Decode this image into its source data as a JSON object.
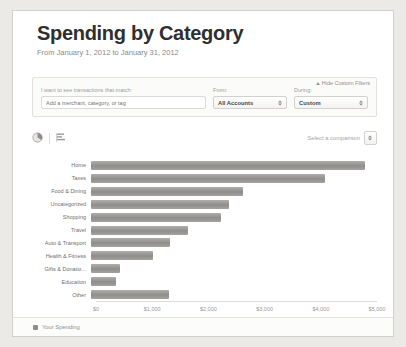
{
  "header": {
    "title": "Spending by Category",
    "date_range": "From January 1, 2012 to January 31, 2012"
  },
  "filters": {
    "hide_filters_label": "Hide Custom Filters",
    "match_label": "I want to see transactions that match:",
    "match_placeholder": "Add a merchant, category, or tag",
    "match_value": "",
    "from_label": "From:",
    "from_value": "All Accounts",
    "during_label": "During:",
    "during_value": "Custom"
  },
  "toolbar": {
    "pie_icon": "pie-chart-icon",
    "bar_icon": "bar-chart-icon",
    "comparison_label": "Select a comparison"
  },
  "footer": {
    "legend_label": "Your Spending",
    "legend_color": "#8f8d89"
  },
  "chart_data": {
    "type": "bar",
    "orientation": "horizontal",
    "title": "Spending by Category",
    "xlabel": "",
    "ylabel": "",
    "xlim": [
      0,
      5000
    ],
    "grid": false,
    "legend_position": "bottom-left",
    "bar_color": "#8f8d89",
    "tick_labels": [
      "$0",
      "$1,000",
      "$2,000",
      "$3,000",
      "$4,000",
      "$5,000"
    ],
    "tick_values": [
      0,
      1000,
      2000,
      3000,
      4000,
      5000
    ],
    "categories": [
      "Home",
      "Taxes",
      "Food & Dining",
      "Uncategorized",
      "Shopping",
      "Travel",
      "Auto & Transport",
      "Health & Fitness",
      "Gifts & Donatio...",
      "Education",
      "Other"
    ],
    "values": [
      4880,
      4160,
      2700,
      2450,
      2320,
      1720,
      1400,
      1100,
      510,
      450,
      1390
    ],
    "series": [
      {
        "name": "Your Spending",
        "values": [
          4880,
          4160,
          2700,
          2450,
          2320,
          1720,
          1400,
          1100,
          510,
          450,
          1390
        ]
      }
    ]
  }
}
